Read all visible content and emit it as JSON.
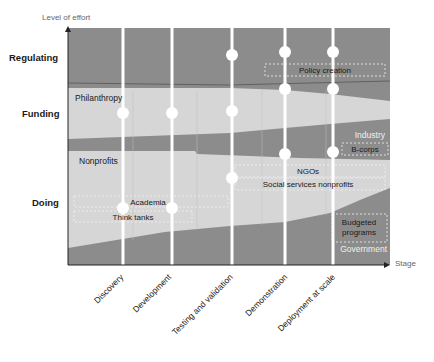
{
  "axes": {
    "y_title": "Level of effort",
    "x_title": "Stage",
    "y_categories": [
      "Regulating",
      "Funding",
      "Doing"
    ],
    "x_stages": [
      "Discovery",
      "Development",
      "Testing and validation",
      "Demonstration",
      "Deployment at scale"
    ]
  },
  "bands": {
    "philanthropy": "Philanthropy",
    "nonprofits": "Nonprofits",
    "industry": "Industry",
    "government": "Government"
  },
  "boxes": {
    "policy_creation": "Policy creation",
    "b_corps": "B-corps",
    "ngos": "NGOs",
    "social_services": "Social services nonprofits",
    "academia": "Academia",
    "think_tanks": "Think tanks",
    "budgeted_programs_line1": "Budgeted",
    "budgeted_programs_line2": "programs"
  },
  "colors": {
    "dark_band": "#8c8c8c",
    "light_band": "#d6d6d6",
    "stage_line": "#ffffff",
    "axis": "#222222"
  },
  "stage_markers": [
    {
      "stage": "Discovery",
      "levels": [
        "Funding",
        "Doing"
      ]
    },
    {
      "stage": "Development",
      "levels": [
        "Funding",
        "Doing"
      ]
    },
    {
      "stage": "Testing and validation",
      "levels": [
        "Regulating",
        "Funding",
        "Doing"
      ]
    },
    {
      "stage": "Demonstration",
      "levels": [
        "Regulating",
        "Regulating",
        "Industry"
      ]
    },
    {
      "stage": "Deployment at scale",
      "levels": [
        "Regulating",
        "Regulating",
        "Industry"
      ]
    }
  ]
}
